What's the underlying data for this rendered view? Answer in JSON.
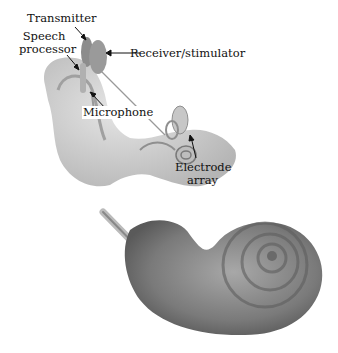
{
  "diagram": {
    "labels": {
      "transmitter": "Transmitter",
      "speech_processor_line1": "Speech",
      "speech_processor_line2": "processor",
      "receiver": "Receiver/stimulator",
      "microphone": "Microphone",
      "electrode_line1": "Electrode",
      "electrode_line2": "array"
    },
    "colors": {
      "skin": "#cfcfcf",
      "device": "#8a8a8a",
      "cochlea": "#7d7d7d",
      "text": "#111111"
    }
  }
}
